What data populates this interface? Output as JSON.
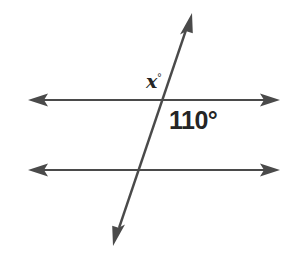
{
  "figure": {
    "type": "geometry-diagram",
    "background_color": "#ffffff",
    "line_color": "#4a4a4a",
    "text_color": "#252525",
    "labels": {
      "unknown_angle": "x",
      "unknown_angle_degree_symbol": "°",
      "known_angle": "110°"
    },
    "lines": [
      {
        "name": "top-parallel-line",
        "orientation": "horizontal",
        "x1": 28,
        "y1": 100,
        "x2": 280,
        "y2": 100,
        "arrows": "both"
      },
      {
        "name": "bottom-parallel-line",
        "orientation": "horizontal",
        "x1": 28,
        "y1": 170,
        "x2": 280,
        "y2": 170,
        "arrows": "both"
      },
      {
        "name": "transversal-line",
        "orientation": "diagonal",
        "x1": 113,
        "y1": 246,
        "x2": 192,
        "y2": 13,
        "arrows": "both"
      }
    ],
    "intersections": [
      {
        "name": "upper-intersection",
        "x": 163,
        "y": 100
      },
      {
        "name": "lower-intersection",
        "x": 139,
        "y": 170
      }
    ]
  }
}
